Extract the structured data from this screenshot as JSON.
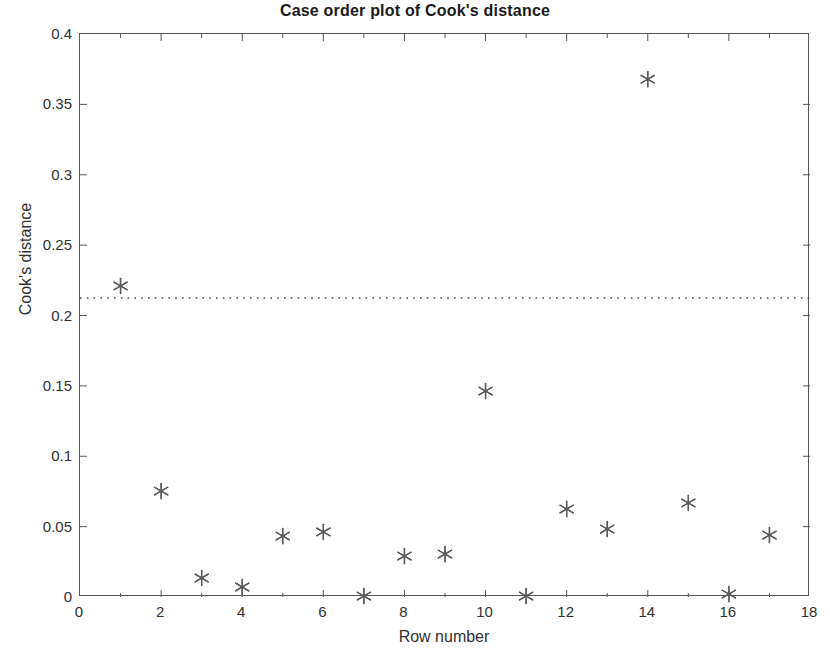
{
  "chart_data": {
    "type": "scatter",
    "title": "Case order plot of Cook's distance",
    "xlabel": "Row number",
    "ylabel": "Cook's distance",
    "xlim": [
      0,
      18
    ],
    "ylim": [
      0,
      0.4
    ],
    "xticks": [
      0,
      2,
      4,
      6,
      8,
      10,
      12,
      14,
      16,
      18
    ],
    "xtick_labels": [
      "0",
      "2",
      "4",
      "6",
      "8",
      "10",
      "12",
      "14",
      "16",
      "18"
    ],
    "yticks": [
      0,
      0.05,
      0.1,
      0.15,
      0.2,
      0.25,
      0.3,
      0.35,
      0.4
    ],
    "ytick_labels": [
      "0",
      "0.05",
      "0.1",
      "0.15",
      "0.2",
      "0.25",
      "0.3",
      "0.35",
      "0.4"
    ],
    "grid": false,
    "legend": "none",
    "marker": "asterisk",
    "marker_color": "#5a5a5a",
    "x": [
      1,
      2,
      3,
      4,
      5,
      6,
      7,
      8,
      9,
      10,
      11,
      12,
      13,
      14,
      15,
      16,
      17
    ],
    "values": [
      0.221,
      0.0753,
      0.0135,
      0.0071,
      0.0433,
      0.0462,
      0.0007,
      0.0291,
      0.0305,
      0.1463,
      0.0007,
      0.0625,
      0.0483,
      0.3679,
      0.0668,
      0.0021,
      0.044
    ],
    "series": [
      {
        "name": "Cook's distance",
        "values": [
          0.221,
          0.0753,
          0.0135,
          0.0071,
          0.0433,
          0.0462,
          0.0007,
          0.0291,
          0.0305,
          0.1463,
          0.0007,
          0.0625,
          0.0483,
          0.3679,
          0.0668,
          0.0021,
          0.044
        ]
      }
    ],
    "reference_line": {
      "orientation": "horizontal",
      "value": 0.2124,
      "style": "dotted",
      "color": "#4a4a4a"
    },
    "axis_color": "#555555",
    "background": "#ffffff"
  }
}
